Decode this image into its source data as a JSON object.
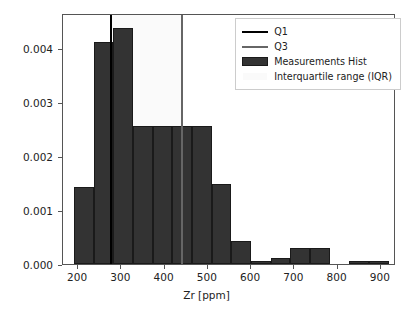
{
  "chart_data": {
    "type": "bar",
    "title": "",
    "subtitle": "",
    "xlabel": "Zr [ppm]",
    "ylabel": "Probability density",
    "grid": false,
    "legend_position": "upper right",
    "xlim": [
      165,
      935
    ],
    "ylim": [
      0.0,
      0.00465
    ],
    "xticks": [
      200,
      300,
      400,
      500,
      600,
      700,
      800,
      900
    ],
    "xticklabels": [
      "200",
      "300",
      "400",
      "500",
      "600",
      "700",
      "800",
      "900"
    ],
    "yticks": [
      0.0,
      0.001,
      0.002,
      0.003,
      0.004
    ],
    "yticklabels": [
      "0.000",
      "0.001",
      "0.002",
      "0.003",
      "0.004"
    ],
    "bin_edges": [
      190,
      236,
      281,
      327,
      372,
      418,
      463,
      509,
      554,
      600,
      645,
      691,
      736,
      782,
      827,
      873,
      918
    ],
    "values": [
      0.00143,
      0.00412,
      0.00437,
      0.00256,
      0.00256,
      0.00256,
      0.00256,
      0.00149,
      0.00042,
      5e-05,
      0.00011,
      0.0003,
      0.0003,
      0.0,
      5e-05,
      5e-05
    ],
    "categories": [
      "190-236",
      "236-281",
      "281-327",
      "327-372",
      "372-418",
      "418-463",
      "463-509",
      "509-554",
      "554-600",
      "600-645",
      "645-691",
      "691-736",
      "736-782",
      "782-827",
      "827-873",
      "873-918"
    ],
    "bar_color": "#333333",
    "bar_edge_color": "#1a1a1a",
    "annotations": [
      {
        "name": "Q1",
        "type": "vline",
        "x": 277,
        "color": "#000000"
      },
      {
        "name": "Q3",
        "type": "vline",
        "x": 441,
        "color": "#666666"
      },
      {
        "name": "Interquartile range (IQR)",
        "type": "vspan",
        "x0": 277,
        "x1": 441,
        "color": "#fafafa"
      }
    ],
    "series": [
      {
        "name": "Measurements Hist",
        "values": [
          0.00143,
          0.00412,
          0.00437,
          0.00256,
          0.00256,
          0.00256,
          0.00256,
          0.00149,
          0.00042,
          5e-05,
          0.00011,
          0.0003,
          0.0003,
          0.0,
          5e-05,
          5e-05
        ]
      }
    ]
  },
  "legend": {
    "items": [
      {
        "label": "Q1",
        "key": "line",
        "color": "#000000"
      },
      {
        "label": "Q3",
        "key": "line",
        "color": "#666666"
      },
      {
        "label": "Measurements Hist",
        "key": "patch",
        "color": "#333333"
      },
      {
        "label": "Interquartile range (IQR)",
        "key": "patch",
        "color": "#fafafa"
      }
    ]
  }
}
